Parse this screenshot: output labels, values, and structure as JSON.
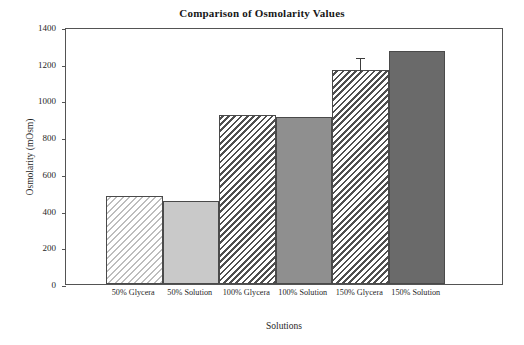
{
  "chart_data": {
    "type": "bar",
    "title": "Comparison of Osmolarity Values",
    "xlabel": "Solutions",
    "ylabel": "Osmolarity (mOsm)",
    "categories": [
      "50% Glycera",
      "50% Solution",
      "100% Glycera",
      "100% Solution",
      "150% Glycera",
      "150% Solution"
    ],
    "values": [
      480,
      452,
      920,
      912,
      1168,
      1272
    ],
    "errors": [
      0,
      0,
      0,
      0,
      76,
      0
    ],
    "ylim": [
      0,
      1400
    ],
    "yticks": [
      0,
      200,
      400,
      600,
      800,
      1000,
      1200,
      1400
    ],
    "ytick_labels": [
      "0",
      "200",
      "400",
      "600",
      "800",
      "1000",
      "1200",
      "1400"
    ],
    "grid": false,
    "legend": "none",
    "bar_styles": [
      "hatch-light",
      "solid-light",
      "hatch-dark",
      "solid-mid",
      "hatch-dark",
      "solid-dark"
    ],
    "colors": {
      "axis": "#545454",
      "bar_edge": "#4a4a4a",
      "solid_light": "#c9c9c9",
      "solid_mid": "#8f8f8f",
      "solid_dark": "#6a6a6a",
      "hatch_light": "#bdbdbd",
      "hatch_dark": "#3f3f3f",
      "error_bar": "#3c3c3c",
      "background": "#ffffff",
      "text": "#1f1f1f"
    }
  }
}
